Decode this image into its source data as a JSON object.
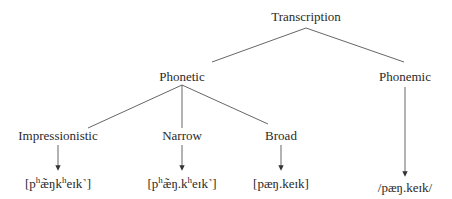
{
  "root": {
    "label": "Transcription"
  },
  "level1": [
    {
      "label": "Phonetic"
    },
    {
      "label": "Phonemic",
      "example": "/pæŋ.keɪk/"
    }
  ],
  "phonetic_children": [
    {
      "label": "Impressionistic",
      "example_parts": [
        "[p",
        "h",
        "æ̃ŋk",
        "h",
        "eɪk˺]"
      ]
    },
    {
      "label": "Narrow",
      "example_parts": [
        "[p",
        "h",
        "æ̃ŋ.k",
        "h",
        "eɪk˺]"
      ]
    },
    {
      "label": "Broad",
      "example": "[pæŋ.keɪk]"
    }
  ],
  "colors": {
    "line": "#555555",
    "text": "#2a2a2a"
  }
}
